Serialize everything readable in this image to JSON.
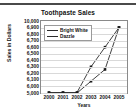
{
  "chart_data": {
    "type": "line",
    "title": "Toothpaste Sales",
    "xlabel": "Years",
    "ylabel": "Sales in Dollars",
    "categories": [
      "2000",
      "2001",
      "2002",
      "2003",
      "2004",
      "2005"
    ],
    "x": [
      2000,
      2001,
      2002,
      2003,
      2004,
      2005
    ],
    "series": [
      {
        "name": "Bright White",
        "values": [
          5050,
          5060,
          5000,
          6080,
          6260,
          6900
        ]
      },
      {
        "name": "Dazzle",
        "values": [
          5050,
          5060,
          5080,
          6300,
          6600,
          6960
        ]
      }
    ],
    "ytick_labels": [
      "10,000",
      "6,900",
      "6,800",
      "6,700",
      "6,600",
      "6,500",
      "6,400",
      "6,300",
      "6,200",
      "6,100",
      "6,000",
      "5,000"
    ],
    "ytick_values": [
      10000,
      6900,
      6800,
      6700,
      6600,
      6500,
      6400,
      6300,
      6200,
      6100,
      6000,
      5000
    ],
    "axis_note": "non-linear truncated y-axis",
    "grid": true,
    "legend_position": "top-left-inside",
    "line_color": "#2b2b2b",
    "marker_color": "#1a1a1a",
    "grid_color": "#d9d9d9",
    "frame_color": "#8a8a8a"
  },
  "legend": {
    "entries": [
      {
        "label": "Bright White"
      },
      {
        "label": "Dazzle"
      }
    ]
  }
}
